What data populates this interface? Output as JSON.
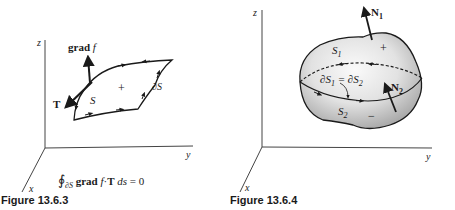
{
  "figures": [
    {
      "caption": "Figure 13.6.3",
      "axes": {
        "z": "z",
        "y": "y",
        "x": "x"
      },
      "labels": {
        "grad_word": "grad",
        "grad_f": "f",
        "tangent": "T",
        "surface": "S",
        "orientation": "+",
        "boundary_partial": "∂",
        "boundary_S": "S"
      },
      "equation": {
        "integral": "∮",
        "integral_sub": "∂S",
        "grad_word": "grad",
        "f": "f",
        "dot": "·",
        "T": "T",
        "ds": "ds",
        "rhs": "= 0"
      }
    },
    {
      "caption": "Figure 13.6.4",
      "axes": {
        "z": "z",
        "y": "y",
        "x": "x"
      },
      "labels": {
        "normal1": "N",
        "normal1_sub": "1",
        "normal2": "N",
        "normal2_sub": "2",
        "surface1": "S",
        "surface1_sub": "1",
        "surface2": "S",
        "surface2_sub": "2",
        "plus": "+",
        "minus": "−",
        "boundary_eq_left": "∂S",
        "boundary_eq_left_sub": "1",
        "boundary_eq_mid": " = ∂S",
        "boundary_eq_right_sub": "2"
      }
    }
  ],
  "colors": {
    "ink": "#1a1a1a",
    "surface_light": "#f4f4f4",
    "surface_shade": "#bdbdbd",
    "axis": "#444444"
  }
}
